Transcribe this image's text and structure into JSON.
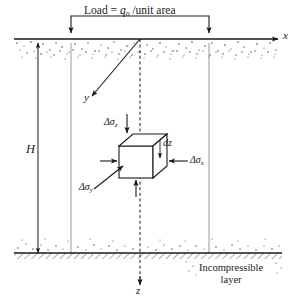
{
  "figure": {
    "width": 296,
    "height": 302,
    "background_color": "#ffffff",
    "line_color": "#1a1a1a",
    "soil_stipple_color": "#4a4a4a"
  },
  "load": {
    "label_prefix": "Load = ",
    "symbol": "q",
    "symbol_subscript": "o",
    "label_suffix": " /unit area",
    "full_text": "Load = qₒ /unit area",
    "arrow_count": 2
  },
  "axes": {
    "x": {
      "label": "x",
      "direction": "right"
    },
    "y": {
      "label": "y",
      "direction": "lower-left"
    },
    "z": {
      "label": "z",
      "direction": "down"
    }
  },
  "depth": {
    "label": "H",
    "description": "thickness of compressible layer"
  },
  "element": {
    "dz_label": "dz",
    "stresses": [
      {
        "name": "delta-sigma-z",
        "symbol": "Δσ",
        "subscript": "z",
        "position": "top",
        "direction": "down"
      },
      {
        "name": "delta-sigma-x",
        "symbol": "Δσ",
        "subscript": "x",
        "position": "right",
        "direction": "left"
      },
      {
        "name": "delta-sigma-y",
        "symbol": "Δσ",
        "subscript": "y",
        "position": "lower-left",
        "direction": "upper-right"
      }
    ]
  },
  "layers": {
    "incompressible": {
      "line1": "Incompressible",
      "line2": "layer"
    }
  }
}
